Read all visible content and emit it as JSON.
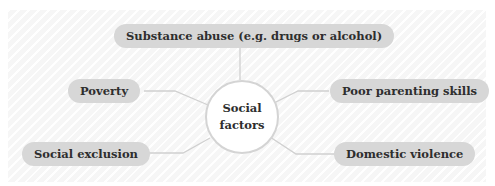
{
  "diagram": {
    "top_cut_text": "",
    "center": {
      "line1": "Social",
      "line2": "factors"
    },
    "nodes": [
      {
        "id": "substance",
        "label": "Substance abuse (e.g. drugs or alcohol)"
      },
      {
        "id": "poverty",
        "label": "Poverty"
      },
      {
        "id": "parenting",
        "label": "Poor parenting skills"
      },
      {
        "id": "exclusion",
        "label": "Social exclusion"
      },
      {
        "id": "violence",
        "label": "Domestic violence"
      }
    ],
    "colors": {
      "pill": "#d7d7d7",
      "line": "#d0d0d0",
      "text": "#2e2e2e"
    }
  }
}
